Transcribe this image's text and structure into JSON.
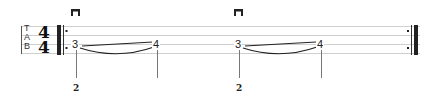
{
  "tab": {
    "clef_letters": [
      "T",
      "A",
      "B"
    ],
    "time_signature": {
      "numerator": "4",
      "denominator": "4"
    },
    "strings_shown": 4,
    "repeat": {
      "start": true,
      "end": true
    },
    "notes": [
      {
        "fret": "3",
        "finger": "2",
        "pick": "downstroke",
        "technique": "slide-start"
      },
      {
        "fret": "4",
        "finger": "",
        "pick": "",
        "technique": "slide-end"
      },
      {
        "fret": "3",
        "finger": "2",
        "pick": "downstroke",
        "technique": "slide-start"
      },
      {
        "fret": "4",
        "finger": "",
        "pick": "",
        "technique": "slide-end"
      }
    ]
  },
  "colors": {
    "staff_line": "#c8c8c8",
    "barline": "#222222",
    "ink": "#222222"
  }
}
